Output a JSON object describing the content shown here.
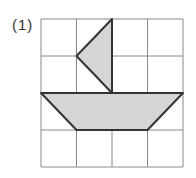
{
  "problem": {
    "label": "(1)"
  },
  "grid": {
    "rows": 4,
    "cols": 4,
    "x0": 41,
    "y0": 19,
    "cell_w": 35.5,
    "cell_h": 37,
    "line_color": "#8a8a8a"
  },
  "shapes": {
    "fill_color": "#d6d6d6",
    "stroke_color": "#333333",
    "sail": {
      "description": "triangle",
      "points_grid": [
        [
          2,
          0
        ],
        [
          1,
          1
        ],
        [
          2,
          2
        ]
      ]
    },
    "hull": {
      "description": "trapezoid",
      "points_grid": [
        [
          0,
          2
        ],
        [
          4,
          2
        ],
        [
          3,
          3
        ],
        [
          1,
          3
        ]
      ]
    }
  }
}
